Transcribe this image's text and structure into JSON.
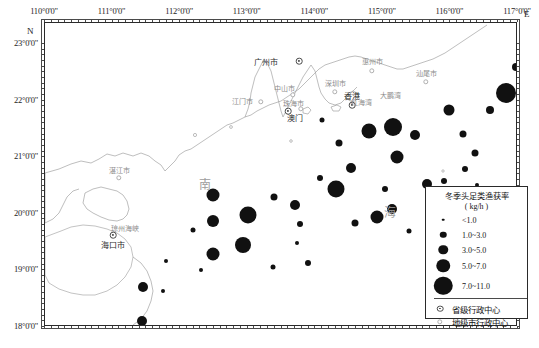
{
  "axes": {
    "top_labels": [
      "110°0'0\"",
      "111°0'0\"",
      "112°0'0\"",
      "113°0'0\"",
      "114°0'0\"",
      "115°0'0\"",
      "116°0'0\"",
      "117°0'0\""
    ],
    "left_labels": [
      "23°0'0\"",
      "22°0'0\"",
      "21°0'0\"",
      "20°0'0\"",
      "19°0'0\"",
      "18°0'0\""
    ],
    "east_marker": "E",
    "north_marker": "N"
  },
  "sea_labels": [
    {
      "text": "南",
      "x": 160,
      "y": 161
    },
    {
      "text": "海",
      "x": 345,
      "y": 189
    }
  ],
  "places": [
    {
      "name": "广州市",
      "x": 221,
      "y": 38,
      "type": "capital",
      "dot_x": 254,
      "dot_y": 38
    },
    {
      "name": "惠州市",
      "x": 327,
      "y": 38,
      "type": "city",
      "dot_x": 327,
      "dot_y": 48
    },
    {
      "name": "汕尾市",
      "x": 381,
      "y": 50,
      "type": "city",
      "dot_x": 381,
      "dot_y": 59
    },
    {
      "name": "深圳市",
      "x": 290,
      "y": 60,
      "type": "city",
      "dot_x": 290,
      "dot_y": 69
    },
    {
      "name": "中山市",
      "x": 239,
      "y": 65,
      "type": "city",
      "dot_x": 248,
      "dot_y": 72
    },
    {
      "name": "江门市",
      "x": 197,
      "y": 78,
      "type": "city",
      "dot_x": 216,
      "dot_y": 79
    },
    {
      "name": "珠海市",
      "x": 248,
      "y": 80,
      "type": "city",
      "dot_x": 256,
      "dot_y": 86
    },
    {
      "name": "香港",
      "x": 307,
      "y": 72,
      "type": "capital",
      "dot_x": 307,
      "dot_y": 82
    },
    {
      "name": "澳门",
      "x": 250,
      "y": 94,
      "type": "capital",
      "dot_x": 243,
      "dot_y": 88
    },
    {
      "name": "湛江市",
      "x": 74,
      "y": 147,
      "type": "city",
      "dot_x": 74,
      "dot_y": 155
    },
    {
      "name": "海口市",
      "x": 68,
      "y": 221,
      "type": "capital",
      "dot_x": 68,
      "dot_y": 212
    },
    {
      "name": "琼州海峡",
      "x": 80,
      "y": 205,
      "type": "label"
    },
    {
      "name": "东沙群岛",
      "x": 445,
      "y": 172,
      "type": "label"
    },
    {
      "name": "大鹏湾",
      "x": 345,
      "y": 72,
      "type": "label"
    },
    {
      "name": "红海湾",
      "x": 316,
      "y": 79,
      "type": "label"
    }
  ],
  "legend": {
    "title": "冬季头足类渔获率",
    "unit": "( kg/h )",
    "classes": [
      {
        "label": "<1.0",
        "size": 2.6
      },
      {
        "label": "1.0~3.0",
        "size": 6.5
      },
      {
        "label": "3.0~5.0",
        "size": 9.5
      },
      {
        "label": "5.0~7.0",
        "size": 13.5
      },
      {
        "label": "7.0~11.0",
        "size": 18.5
      }
    ],
    "markers": [
      {
        "label": "省级行政中心",
        "icon": "capital-dot-icon"
      },
      {
        "label": "地级市行政中心",
        "icon": "city-dot-icon"
      }
    ]
  },
  "chart_data": {
    "type": "scatter",
    "title": "冬季头足类渔获率",
    "unit": "kg/h",
    "xlabel": "经度 (E)",
    "ylabel": "纬度 (N)",
    "xlim": [
      110,
      117
    ],
    "ylim": [
      18,
      23
    ],
    "grid": false,
    "legend_position": "bottom-right",
    "size_classes": [
      "<1.0",
      "1.0~3.0",
      "3.0~5.0",
      "5.0~7.0",
      "7.0~11.0"
    ],
    "points": [
      {
        "x": 324,
        "y": 108,
        "d": 15,
        "v": 6.0
      },
      {
        "x": 348,
        "y": 104,
        "d": 18,
        "v": 8.5
      },
      {
        "x": 352,
        "y": 134,
        "d": 13,
        "v": 5.4
      },
      {
        "x": 294,
        "y": 120,
        "d": 7,
        "v": 2.2
      },
      {
        "x": 306,
        "y": 145,
        "d": 10,
        "v": 3.6
      },
      {
        "x": 370,
        "y": 112,
        "d": 10,
        "v": 3.4
      },
      {
        "x": 418,
        "y": 111,
        "d": 7,
        "v": 2.0
      },
      {
        "x": 430,
        "y": 130,
        "d": 7,
        "v": 2.1
      },
      {
        "x": 420,
        "y": 146,
        "d": 6,
        "v": 1.6
      },
      {
        "x": 461,
        "y": 70,
        "d": 20,
        "v": 9.8
      },
      {
        "x": 471,
        "y": 44,
        "d": 8,
        "v": 2.5
      },
      {
        "x": 483,
        "y": 59,
        "d": 7,
        "v": 2.0
      },
      {
        "x": 445,
        "y": 87,
        "d": 8,
        "v": 2.4
      },
      {
        "x": 404,
        "y": 87,
        "d": 11,
        "v": 4.1
      },
      {
        "x": 291,
        "y": 166,
        "d": 17,
        "v": 7.5
      },
      {
        "x": 275,
        "y": 155,
        "d": 6,
        "v": 1.7
      },
      {
        "x": 340,
        "y": 166,
        "d": 6,
        "v": 1.5
      },
      {
        "x": 382,
        "y": 161,
        "d": 10,
        "v": 3.5
      },
      {
        "x": 399,
        "y": 158,
        "d": 6,
        "v": 1.4
      },
      {
        "x": 393,
        "y": 177,
        "d": 6,
        "v": 1.6
      },
      {
        "x": 347,
        "y": 186,
        "d": 10,
        "v": 3.3
      },
      {
        "x": 332,
        "y": 194,
        "d": 13,
        "v": 5.2
      },
      {
        "x": 310,
        "y": 200,
        "d": 7,
        "v": 2.1
      },
      {
        "x": 250,
        "y": 182,
        "d": 10,
        "v": 3.4
      },
      {
        "x": 255,
        "y": 201,
        "d": 6,
        "v": 1.5
      },
      {
        "x": 229,
        "y": 174,
        "d": 7,
        "v": 2.0
      },
      {
        "x": 203,
        "y": 192,
        "d": 17,
        "v": 7.6
      },
      {
        "x": 198,
        "y": 222,
        "d": 16,
        "v": 7.0
      },
      {
        "x": 168,
        "y": 172,
        "d": 13,
        "v": 5.3
      },
      {
        "x": 168,
        "y": 198,
        "d": 12,
        "v": 4.6
      },
      {
        "x": 168,
        "y": 231,
        "d": 13,
        "v": 5.1
      },
      {
        "x": 148,
        "y": 207,
        "d": 5,
        "v": 1.2
      },
      {
        "x": 156,
        "y": 247,
        "d": 4,
        "v": 1.0
      },
      {
        "x": 121,
        "y": 238,
        "d": 4,
        "v": 0.8
      },
      {
        "x": 118,
        "y": 268,
        "d": 4,
        "v": 0.9
      },
      {
        "x": 98,
        "y": 264,
        "d": 10,
        "v": 3.2
      },
      {
        "x": 97,
        "y": 298,
        "d": 10,
        "v": 3.1
      },
      {
        "x": 103,
        "y": 317,
        "d": 10,
        "v": 3.3
      },
      {
        "x": 155,
        "y": 306,
        "d": 5,
        "v": 1.1
      },
      {
        "x": 211,
        "y": 323,
        "d": 9,
        "v": 2.9
      },
      {
        "x": 432,
        "y": 162,
        "d": 4,
        "v": 0.9
      },
      {
        "x": 444,
        "y": 187,
        "d": 4,
        "v": 0.8
      },
      {
        "x": 277,
        "y": 97,
        "d": 5,
        "v": 1.2
      },
      {
        "x": 398,
        "y": 204,
        "d": 6,
        "v": 1.5
      },
      {
        "x": 364,
        "y": 208,
        "d": 5,
        "v": 1.1
      },
      {
        "x": 252,
        "y": 220,
        "d": 4,
        "v": 0.9
      },
      {
        "x": 263,
        "y": 240,
        "d": 6,
        "v": 1.4
      },
      {
        "x": 228,
        "y": 244,
        "d": 5,
        "v": 1.0
      }
    ]
  }
}
